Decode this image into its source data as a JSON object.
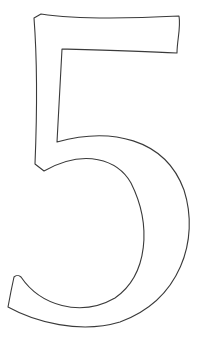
{
  "image": {
    "subject": "Outlined numeral",
    "character": "5",
    "style": "outline",
    "colors": {
      "background": "#ffffff",
      "stroke": "#3a3a3a",
      "fill": "#ffffff"
    }
  }
}
